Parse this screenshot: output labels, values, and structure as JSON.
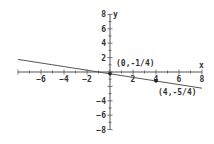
{
  "chart_data": {
    "type": "line",
    "title": "",
    "xlabel": "x",
    "ylabel": "y",
    "xlim": [
      -8,
      8
    ],
    "ylim": [
      -8,
      8
    ],
    "x_ticks": [
      -6,
      -4,
      -2,
      2,
      4,
      6,
      8
    ],
    "y_ticks": [
      8,
      6,
      4,
      2,
      -4,
      -6,
      -8
    ],
    "grid": false,
    "series": [
      {
        "name": "y = -x/4 - 1/4",
        "x": [
          -8,
          8
        ],
        "values": [
          1.75,
          -2.25
        ]
      }
    ],
    "points": [
      {
        "x": 0,
        "y": -0.25,
        "label": "(0,-1/4)"
      },
      {
        "x": 4,
        "y": -1.25,
        "label": "(4,-5/4)"
      }
    ],
    "colors": {
      "axis": "#555555",
      "line": "#555555",
      "point": "#222222"
    }
  }
}
